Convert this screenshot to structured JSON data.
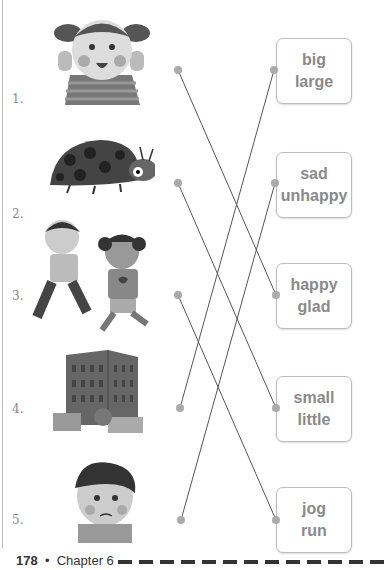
{
  "items": [
    {
      "number": "1.",
      "picture": "happy-girl-arms-raised",
      "top": 62
    },
    {
      "number": "2.",
      "picture": "ladybug",
      "top": 177
    },
    {
      "number": "3.",
      "picture": "two-children-running",
      "top": 289
    },
    {
      "number": "4.",
      "picture": "tall-building",
      "top": 402
    },
    {
      "number": "5.",
      "picture": "sad-boy",
      "top": 513
    }
  ],
  "word_boxes": [
    {
      "line1": "big",
      "line2": "large"
    },
    {
      "line1": "sad",
      "line2": "unhappy"
    },
    {
      "line1": "happy",
      "line2": "glad"
    },
    {
      "line1": "small",
      "line2": "little"
    },
    {
      "line1": "jog",
      "line2": "run"
    }
  ],
  "connections": [
    {
      "from_item": 1,
      "to_box": 3
    },
    {
      "from_item": 2,
      "to_box": 4
    },
    {
      "from_item": 3,
      "to_box": 5
    },
    {
      "from_item": 4,
      "to_box": 1
    },
    {
      "from_item": 5,
      "to_box": 2
    }
  ],
  "footer": {
    "page_number": "178",
    "separator": "•",
    "chapter": "Chapter 6"
  }
}
